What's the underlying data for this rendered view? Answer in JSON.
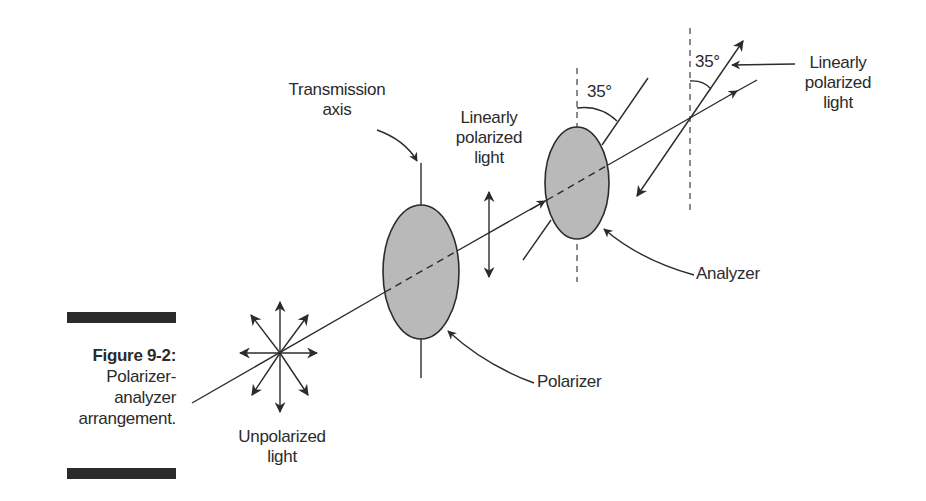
{
  "figure": {
    "number_label": "Figure 9-2:",
    "caption_lines": [
      "Polarizer-",
      "analyzer",
      "arrangement."
    ]
  },
  "labels": {
    "transmission_axis": [
      "Transmission",
      "axis"
    ],
    "linearly_polarized_mid": [
      "Linearly",
      "polarized",
      "light"
    ],
    "linearly_polarized_right": [
      "Linearly",
      "polarized",
      "light"
    ],
    "unpolarized": [
      "Unpolarized",
      "light"
    ],
    "polarizer": "Polarizer",
    "analyzer": "Analyzer",
    "angle_analyzer": "35°",
    "angle_output": "35°"
  },
  "colors": {
    "ink": "#2b2b2b",
    "filter_fill": "#b9b9b9",
    "background": "#ffffff"
  }
}
